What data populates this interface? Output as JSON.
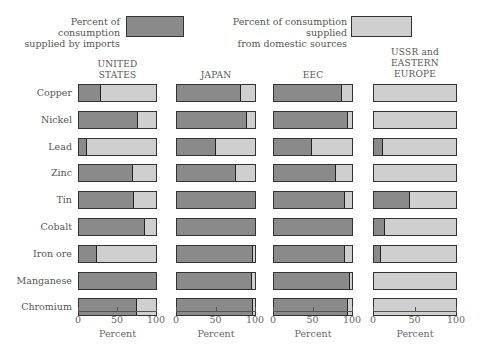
{
  "legend": {
    "imports_label_line1": "Percent of consumption",
    "imports_label_line2": "supplied by imports",
    "domestic_label_line1": "Percent of consumption supplied",
    "domestic_label_line2": "from domestic sources",
    "imports_color": "#8a8a8a",
    "domestic_color": "#cfcfcf"
  },
  "panels": [
    {
      "title_lines": [
        "UNITED",
        "STATES"
      ]
    },
    {
      "title_lines": [
        "JAPAN"
      ]
    },
    {
      "title_lines": [
        "EEC"
      ]
    },
    {
      "title_lines": [
        "USSR and",
        "EASTERN",
        "EUROPE"
      ]
    }
  ],
  "rows": [
    "Copper",
    "Nickel",
    "Lead",
    "Zinc",
    "Tin",
    "Cobalt",
    "Iron ore",
    "Manganese",
    "Chromium"
  ],
  "axis": {
    "ticks": [
      "0",
      "50",
      "100"
    ],
    "title": "Percent"
  },
  "chart_data": {
    "type": "bar",
    "orientation": "horizontal",
    "stacked": true,
    "title": "",
    "categories": [
      "Copper",
      "Nickel",
      "Lead",
      "Zinc",
      "Tin",
      "Cobalt",
      "Iron ore",
      "Manganese",
      "Chromium"
    ],
    "facets": [
      "UNITED STATES",
      "JAPAN",
      "EEC",
      "USSR and EASTERN EUROPE"
    ],
    "legend": [
      "Percent of consumption supplied by imports",
      "Percent of consumption supplied from domestic sources"
    ],
    "legend_position": "top",
    "xlabel": "Percent",
    "xlim": [
      0,
      100
    ],
    "xticks": [
      0,
      50,
      100
    ],
    "grid": false,
    "series": [
      {
        "facet": "UNITED STATES",
        "name": "imports",
        "values": [
          28,
          77,
          10,
          70,
          72,
          86,
          23,
          100,
          75
        ]
      },
      {
        "facet": "UNITED STATES",
        "name": "domestic",
        "values": [
          72,
          23,
          90,
          30,
          28,
          14,
          77,
          0,
          25
        ]
      },
      {
        "facet": "JAPAN",
        "name": "imports",
        "values": [
          82,
          90,
          50,
          75,
          100,
          100,
          98,
          96,
          98
        ]
      },
      {
        "facet": "JAPAN",
        "name": "domestic",
        "values": [
          18,
          10,
          50,
          25,
          0,
          0,
          2,
          4,
          2
        ]
      },
      {
        "facet": "EEC",
        "name": "imports",
        "values": [
          87,
          95,
          49,
          80,
          91,
          100,
          91,
          98,
          95
        ]
      },
      {
        "facet": "EEC",
        "name": "domestic",
        "values": [
          13,
          5,
          51,
          20,
          9,
          0,
          9,
          2,
          5
        ]
      },
      {
        "facet": "USSR and EASTERN EUROPE",
        "name": "imports",
        "values": [
          0,
          0,
          11,
          0,
          44,
          14,
          8,
          0,
          0
        ]
      },
      {
        "facet": "USSR and EASTERN EUROPE",
        "name": "domestic",
        "values": [
          100,
          100,
          89,
          100,
          56,
          86,
          92,
          100,
          100
        ]
      }
    ]
  }
}
